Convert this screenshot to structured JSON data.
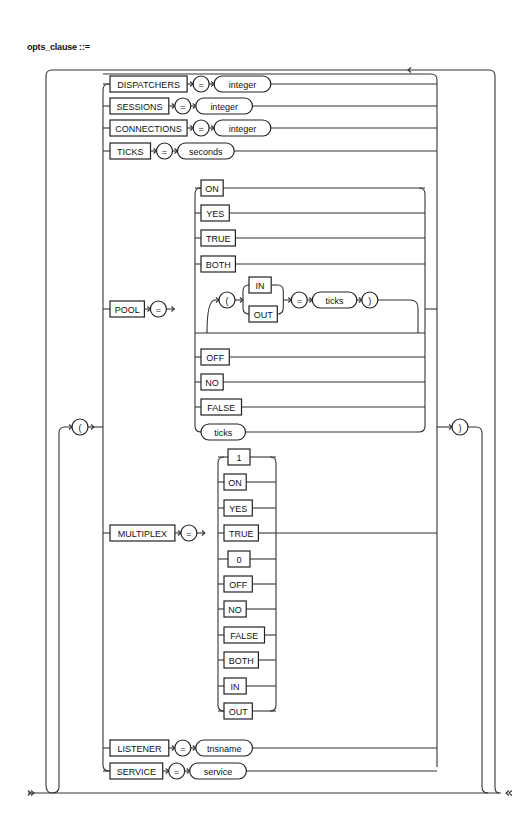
{
  "title": "opts_clause ::=",
  "delimiters": {
    "open": "(",
    "close": ")"
  },
  "equals": "=",
  "options": [
    {
      "keyword": "DISPATCHERS",
      "value": "integer"
    },
    {
      "keyword": "SESSIONS",
      "value": "integer"
    },
    {
      "keyword": "CONNECTIONS",
      "value": "integer"
    },
    {
      "keyword": "TICKS",
      "value": "seconds"
    },
    {
      "keyword": "POOL"
    },
    {
      "keyword": "MULTIPLEX"
    },
    {
      "keyword": "LISTENER",
      "value": "tnsname"
    },
    {
      "keyword": "SERVICE",
      "value": "service"
    }
  ],
  "pool": {
    "values_top": [
      "ON",
      "YES",
      "TRUE",
      "BOTH"
    ],
    "loop": {
      "open": "(",
      "choices": [
        "IN",
        "OUT"
      ],
      "equals": "=",
      "value": "ticks",
      "close": ")"
    },
    "values_bottom": [
      "OFF",
      "NO",
      "FALSE"
    ],
    "value_var": "ticks"
  },
  "multiplex": {
    "values": [
      "1",
      "ON",
      "YES",
      "TRUE",
      "0",
      "OFF",
      "NO",
      "FALSE",
      "BOTH",
      "IN",
      "OUT"
    ]
  }
}
